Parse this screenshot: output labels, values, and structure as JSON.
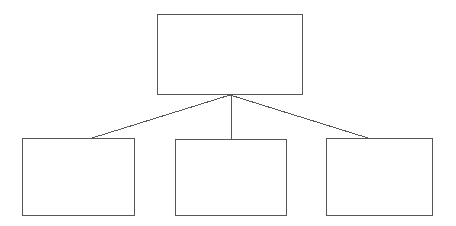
{
  "diagram": {
    "type": "hierarchy-tree",
    "title": "",
    "canvas": {
      "width": 456,
      "height": 226,
      "background_color": "#ffffff"
    },
    "style": {
      "stroke_color": "#565656",
      "stroke_width": 1,
      "node_fill_color": "#ffffff",
      "connector_color": "#565656",
      "connector_width": 1
    },
    "junction": {
      "x": 230,
      "y": 95
    },
    "nodes": [
      {
        "id": "root",
        "role": "parent",
        "label": "",
        "x": 157,
        "y": 14,
        "width": 146,
        "height": 81
      },
      {
        "id": "child-1",
        "role": "child",
        "label": "",
        "x": 22,
        "y": 138,
        "width": 113,
        "height": 78
      },
      {
        "id": "child-2",
        "role": "child",
        "label": "",
        "x": 175,
        "y": 139,
        "width": 112,
        "height": 77
      },
      {
        "id": "child-3",
        "role": "child",
        "label": "",
        "x": 326,
        "y": 138,
        "width": 107,
        "height": 78
      }
    ],
    "connectors": [
      {
        "id": "connector-root-child-1",
        "from": "root",
        "to": "child-1",
        "x1": 230,
        "y1": 95,
        "x2": 92,
        "y2": 138
      },
      {
        "id": "connector-root-child-2",
        "from": "root",
        "to": "child-2",
        "x1": 231,
        "y1": 95,
        "x2": 231,
        "y2": 139
      },
      {
        "id": "connector-root-child-3",
        "from": "root",
        "to": "child-3",
        "x1": 230,
        "y1": 95,
        "x2": 368,
        "y2": 138
      }
    ]
  }
}
